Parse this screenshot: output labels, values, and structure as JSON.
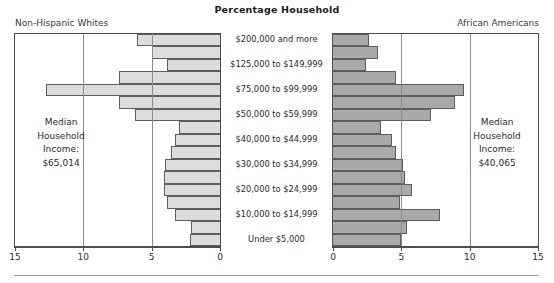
{
  "title": "Percentage Household",
  "left_group_label": "Non-Hispanic Whites",
  "right_group_label": "African Americans",
  "left_median": {
    "line1": "Median",
    "line2": "Household",
    "line3": "Income:",
    "line4": "$65,014"
  },
  "right_median": {
    "line1": "Median",
    "line2": "Household",
    "line3": "Income:",
    "line4": "$40,065"
  },
  "axis": {
    "left_ticks": [
      "15",
      "10",
      "5",
      "0"
    ],
    "right_ticks": [
      "0",
      "5",
      "10",
      "15"
    ]
  },
  "chart_data": {
    "type": "bar",
    "subtype": "population-pyramid",
    "title": "Percentage Household",
    "xlabel": "Percentage Household",
    "ylabel": "",
    "xlim": [
      0,
      15
    ],
    "grid": true,
    "legend_position": "corners",
    "left_axis_direction": "reversed",
    "categories": [
      "$200,000 and more",
      "$150,000 to $199,999",
      "$125,000 to $149,999",
      "$100,000 to $124,999",
      "$75,000 to $99,999",
      "$60,000 to $74,999",
      "$50,000 to $59,999",
      "$45,000 to $49,999",
      "$40,000 to $44,999",
      "$35,000 to $39,999",
      "$30,000 to $34,999",
      "$25,000 to $29,999",
      "$20,000 to $24,999",
      "$15,000 to $19,999",
      "$10,000 to $14,999",
      "$5,000 to $9,999",
      "Under $5,000"
    ],
    "visible_category_labels": [
      "$200,000 and more",
      "$125,000 to $149,999",
      "$75,000 to $99,999",
      "$50,000 to $59,999",
      "$40,000 to $44,999",
      "$30,000 to $34,999",
      "$20,000 to $24,999",
      "$10,000 to $14,999",
      "Under $5,000"
    ],
    "series": [
      {
        "name": "Non-Hispanic Whites",
        "side": "left",
        "color": "#dcdcdc",
        "values": [
          6.1,
          5.0,
          3.9,
          7.4,
          12.7,
          7.4,
          6.2,
          3.0,
          3.3,
          3.6,
          4.0,
          4.1,
          4.1,
          3.9,
          3.3,
          2.1,
          2.2
        ]
      },
      {
        "name": "African Americans",
        "side": "right",
        "color": "#a9a9a9",
        "values": [
          2.6,
          3.3,
          2.4,
          4.6,
          9.6,
          8.9,
          7.2,
          3.5,
          4.3,
          4.6,
          5.1,
          5.3,
          5.8,
          4.9,
          7.8,
          5.4,
          5.0
        ]
      }
    ],
    "medians": {
      "Non-Hispanic Whites": "$65,014",
      "African Americans": "$40,065"
    }
  }
}
